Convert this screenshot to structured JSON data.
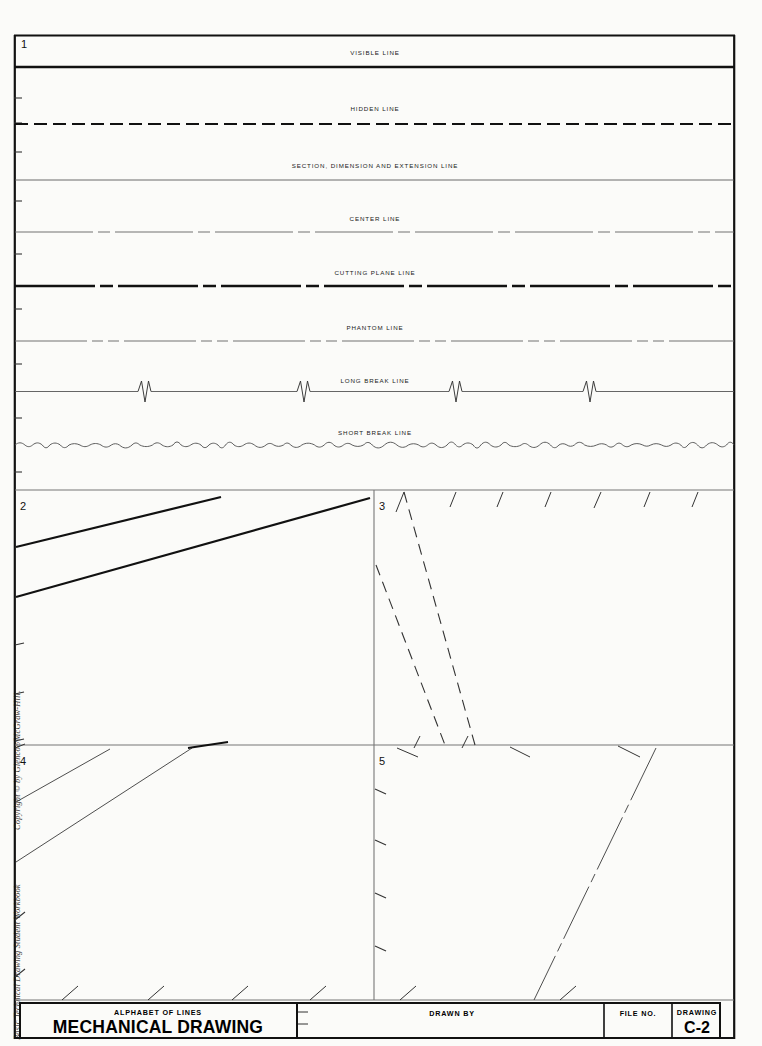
{
  "sheet": {
    "drawing_number": "C-2",
    "box_numbers": [
      "1",
      "2",
      "3",
      "4",
      "5"
    ]
  },
  "line_types": [
    {
      "id": "visible",
      "label": "VISIBLE LINE",
      "style": "solid-thick"
    },
    {
      "id": "hidden",
      "label": "HIDDEN LINE",
      "style": "dashed-medium"
    },
    {
      "id": "section",
      "label": "SECTION, DIMENSION AND EXTENSION LINE",
      "style": "solid-thin"
    },
    {
      "id": "center",
      "label": "CENTER LINE",
      "style": "long-short-thin"
    },
    {
      "id": "cutting",
      "label": "CUTTING PLANE LINE",
      "style": "long-short-thick"
    },
    {
      "id": "phantom",
      "label": "PHANTOM LINE",
      "style": "long-short-short-thin"
    },
    {
      "id": "longbreak",
      "label": "LONG BREAK LINE",
      "style": "thin-with-zigzag"
    },
    {
      "id": "shortbreak",
      "label": "SHORT BREAK LINE",
      "style": "freehand-wavy"
    }
  ],
  "title_block": {
    "subject_label": "ALPHABET OF LINES",
    "course_label": "MECHANICAL DRAWING",
    "drawn_by_label": "DRAWN BY",
    "file_no_label": "FILE NO.",
    "drawing_label": "DRAWING",
    "drawing_value": "C-2"
  },
  "margin": {
    "copyright": "Copyright © by Glencoe/McGraw-Hill.",
    "workbook": "Basic Technical Drawing Student Workbook"
  },
  "colors": {
    "ink": "#1a1a1a",
    "thin_ink": "#555555",
    "paper": "#fbfbf9"
  }
}
